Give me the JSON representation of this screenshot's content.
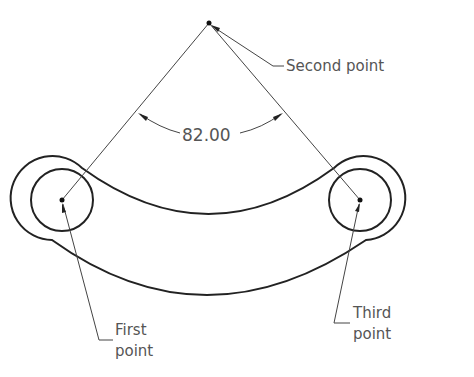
{
  "diagram": {
    "type": "angular-dimension-drawing",
    "dimension_value": "82.00",
    "labels": {
      "second_point": "Second point",
      "first_point_line1": "First",
      "first_point_line2": "point",
      "third_point_line1": "Third",
      "third_point_line2": "point"
    },
    "colors": {
      "geometry": "#222222",
      "annotation": "#555555",
      "background": "#ffffff"
    }
  }
}
